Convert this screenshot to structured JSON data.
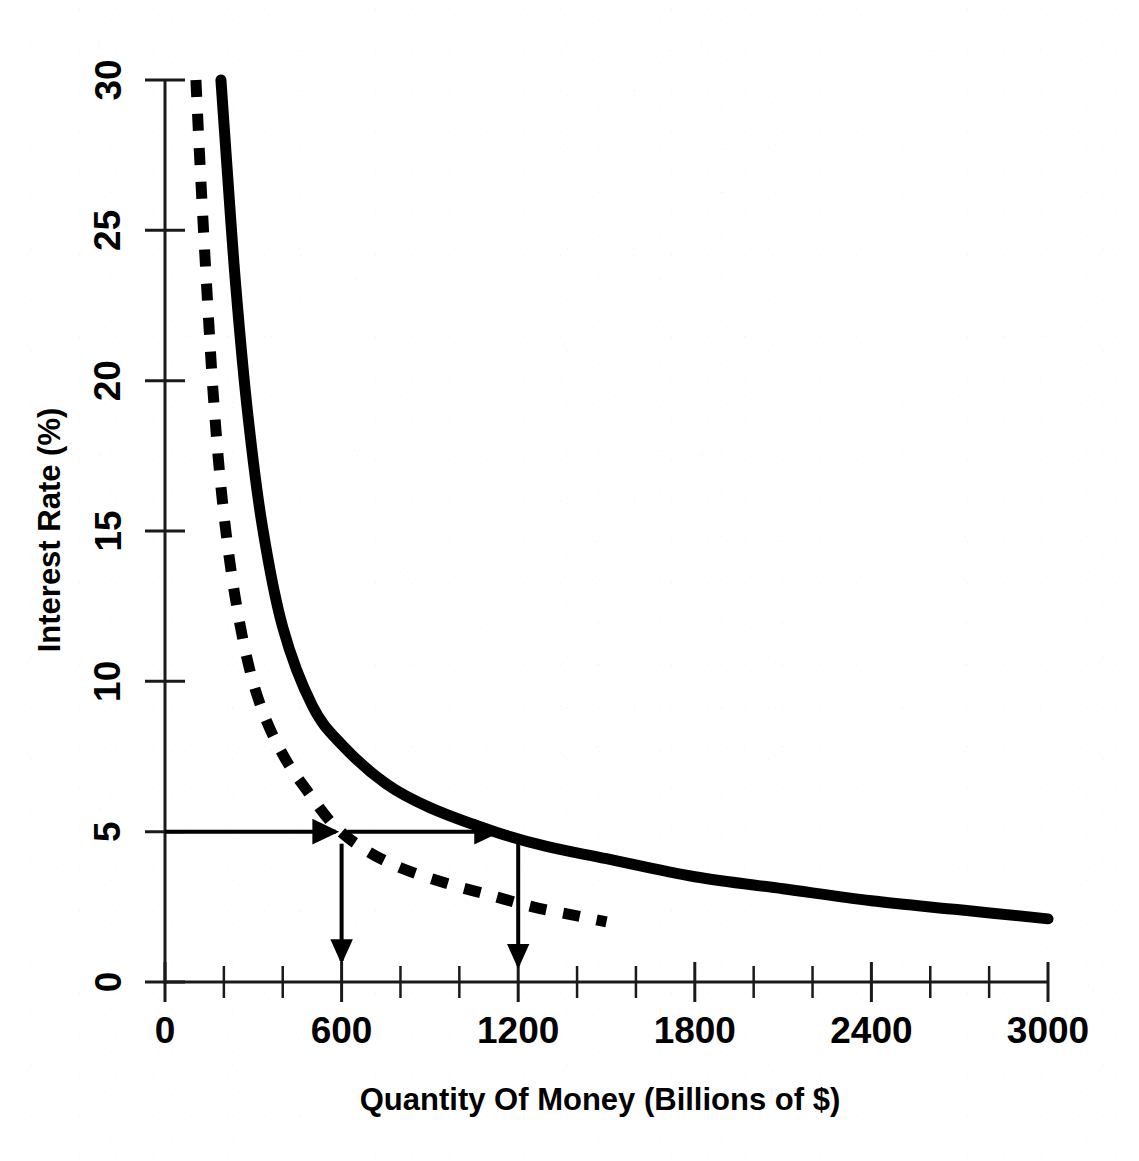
{
  "chart_data": {
    "type": "line",
    "title": "",
    "xlabel": "Quantity Of Money (Billions of $)",
    "ylabel": "Interest Rate (%)",
    "xlim": [
      0,
      3000
    ],
    "ylim": [
      0,
      30
    ],
    "grid": false,
    "legend": "none",
    "x_ticks": [
      0,
      600,
      1200,
      1800,
      2400,
      3000
    ],
    "x_tick_labels": [
      "0",
      "600",
      "1200",
      "1800",
      "2400",
      "3000"
    ],
    "x_minor_tick_step": 200,
    "y_ticks": [
      0,
      5,
      10,
      15,
      20,
      25,
      30
    ],
    "y_tick_labels": [
      "0",
      "5",
      "10",
      "15",
      "20",
      "25",
      "30"
    ],
    "series": [
      {
        "name": "money-demand-curve-solid",
        "style": "solid",
        "linewidth": 11,
        "color": "#000000",
        "x": [
          190,
          210,
          240,
          280,
          330,
          400,
          500,
          600,
          750,
          900,
          1120,
          1300,
          1500,
          1800,
          2100,
          2400,
          2700,
          3000
        ],
        "y": [
          30.0,
          27.2,
          23.2,
          19.0,
          15.2,
          11.8,
          9.2,
          7.9,
          6.6,
          5.8,
          5.0,
          4.5,
          4.1,
          3.5,
          3.1,
          2.7,
          2.4,
          2.1
        ]
      },
      {
        "name": "money-demand-curve-dashed",
        "style": "dashed",
        "linewidth": 11,
        "color": "#000000",
        "x": [
          105,
          120,
          140,
          165,
          195,
          235,
          285,
          340,
          410,
          480,
          575,
          680,
          800,
          950,
          1100,
          1250,
          1400,
          1500
        ],
        "y": [
          30.0,
          27.0,
          23.4,
          19.4,
          16.0,
          13.0,
          10.5,
          8.8,
          7.4,
          6.4,
          5.2,
          4.4,
          3.8,
          3.3,
          2.9,
          2.5,
          2.2,
          2.0
        ]
      }
    ],
    "annotations": [
      {
        "name": "interest-rate-level-arrow-1",
        "type": "arrow",
        "kind": "horizontal",
        "from": {
          "x": 0,
          "y": 5
        },
        "to": {
          "x": 580,
          "y": 5
        }
      },
      {
        "name": "interest-rate-level-arrow-2",
        "type": "arrow",
        "kind": "horizontal",
        "from": {
          "x": 620,
          "y": 5
        },
        "to": {
          "x": 1130,
          "y": 5
        }
      },
      {
        "name": "quantity-drop-arrow-600",
        "type": "arrow",
        "kind": "vertical",
        "from": {
          "x": 600,
          "y": 4.6
        },
        "to": {
          "x": 600,
          "y": 0.7
        }
      },
      {
        "name": "quantity-drop-arrow-1200",
        "type": "arrow",
        "kind": "vertical",
        "from": {
          "x": 1200,
          "y": 4.6
        },
        "to": {
          "x": 1200,
          "y": 0.55
        }
      }
    ]
  }
}
